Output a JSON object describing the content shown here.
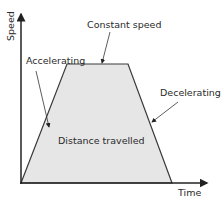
{
  "diagram": {
    "type": "speed-time graph",
    "axes": {
      "x_label": "Time",
      "y_label": "Speed"
    },
    "regions": {
      "area_label": "Distance travelled"
    },
    "annotations": {
      "accelerating": "Accelerating",
      "constant": "Constant speed",
      "decelerating": "Decelerating"
    },
    "colors": {
      "fill": "#e6e6e6",
      "stroke": "#3a3a3a",
      "axis": "#222222"
    }
  }
}
